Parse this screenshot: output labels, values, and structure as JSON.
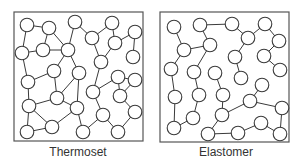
{
  "diagram": {
    "colors": {
      "stroke": "#3a3a3a",
      "node_fill": "#ffffff",
      "box": "#555555",
      "text": "#333333"
    },
    "node_radius": 6.8,
    "panels": [
      {
        "id": "thermoset",
        "label": "Thermoset",
        "box": {
          "x": 14,
          "y": 12,
          "w": 129,
          "h": 129
        },
        "nodes": [
          [
            27,
            25
          ],
          [
            49,
            28
          ],
          [
            75,
            22
          ],
          [
            112,
            23
          ],
          [
            135,
            32
          ],
          [
            22,
            53
          ],
          [
            43,
            50
          ],
          [
            68,
            50
          ],
          [
            92,
            38
          ],
          [
            115,
            43
          ],
          [
            133,
            57
          ],
          [
            101,
            62
          ],
          [
            54,
            71
          ],
          [
            79,
            73
          ],
          [
            118,
            77
          ],
          [
            135,
            80
          ],
          [
            28,
            82
          ],
          [
            93,
            92
          ],
          [
            120,
            96
          ],
          [
            57,
            98
          ],
          [
            29,
            106
          ],
          [
            77,
            108
          ],
          [
            135,
            112
          ],
          [
            103,
            115
          ],
          [
            27,
            132
          ],
          [
            52,
            127
          ],
          [
            83,
            132
          ],
          [
            118,
            132
          ]
        ],
        "edges": [
          [
            0,
            1
          ],
          [
            0,
            5
          ],
          [
            1,
            6
          ],
          [
            1,
            7
          ],
          [
            5,
            6
          ],
          [
            6,
            7
          ],
          [
            5,
            16
          ],
          [
            2,
            7
          ],
          [
            3,
            8
          ],
          [
            8,
            2
          ],
          [
            3,
            9
          ],
          [
            9,
            4
          ],
          [
            4,
            10
          ],
          [
            8,
            11
          ],
          [
            9,
            11
          ],
          [
            7,
            13
          ],
          [
            7,
            12
          ],
          [
            12,
            16
          ],
          [
            12,
            19
          ],
          [
            13,
            19
          ],
          [
            13,
            21
          ],
          [
            11,
            17
          ],
          [
            17,
            14
          ],
          [
            14,
            15
          ],
          [
            14,
            18
          ],
          [
            15,
            18
          ],
          [
            18,
            22
          ],
          [
            16,
            20
          ],
          [
            19,
            20
          ],
          [
            20,
            24
          ],
          [
            20,
            25
          ],
          [
            19,
            21
          ],
          [
            21,
            25
          ],
          [
            21,
            26
          ],
          [
            17,
            23
          ],
          [
            23,
            26
          ],
          [
            23,
            27
          ],
          [
            27,
            22
          ],
          [
            24,
            25
          ]
        ]
      },
      {
        "id": "elastomer",
        "label": "Elastomer",
        "box": {
          "x": 160,
          "y": 12,
          "w": 129,
          "h": 130
        },
        "nodes": [
          [
            174,
            27
          ],
          [
            200,
            25
          ],
          [
            232,
            24
          ],
          [
            265,
            24
          ],
          [
            184,
            50
          ],
          [
            210,
            45
          ],
          [
            248,
            38
          ],
          [
            279,
            41
          ],
          [
            235,
            57
          ],
          [
            264,
            56
          ],
          [
            171,
            69
          ],
          [
            194,
            72
          ],
          [
            215,
            73
          ],
          [
            280,
            70
          ],
          [
            241,
            78
          ],
          [
            262,
            85
          ],
          [
            175,
            97
          ],
          [
            199,
            95
          ],
          [
            223,
            95
          ],
          [
            250,
            101
          ],
          [
            282,
            108
          ],
          [
            193,
            118
          ],
          [
            222,
            115
          ],
          [
            261,
            123
          ],
          [
            174,
            128
          ],
          [
            208,
            134
          ],
          [
            238,
            133
          ],
          [
            280,
            134
          ]
        ],
        "edges": [
          [
            0,
            4
          ],
          [
            4,
            5
          ],
          [
            1,
            5
          ],
          [
            1,
            2
          ],
          [
            2,
            6
          ],
          [
            6,
            3
          ],
          [
            3,
            7
          ],
          [
            6,
            8
          ],
          [
            8,
            14
          ],
          [
            9,
            13
          ],
          [
            9,
            7
          ],
          [
            4,
            10
          ],
          [
            10,
            16
          ],
          [
            16,
            24
          ],
          [
            24,
            21
          ],
          [
            5,
            11
          ],
          [
            11,
            17
          ],
          [
            17,
            21
          ],
          [
            12,
            18
          ],
          [
            18,
            22
          ],
          [
            22,
            25
          ],
          [
            25,
            26
          ],
          [
            26,
            23
          ],
          [
            23,
            27
          ],
          [
            27,
            20
          ],
          [
            20,
            19
          ],
          [
            19,
            22
          ],
          [
            19,
            15
          ]
        ]
      }
    ]
  }
}
